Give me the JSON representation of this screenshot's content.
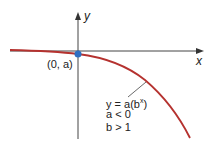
{
  "axes": {
    "x_label": "x",
    "y_label": "y"
  },
  "point": {
    "label": "(0, a)",
    "color": "#2f6fc2"
  },
  "curve": {
    "color": "#b5322f"
  },
  "annotation": {
    "equation": "y = a(b",
    "exponent": "x",
    "eq_close": ")",
    "cond1": "a < 0",
    "cond2": "b > 1"
  }
}
